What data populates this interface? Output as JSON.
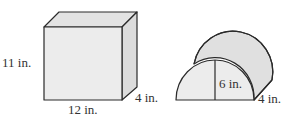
{
  "colors": {
    "face_front": "#ececec",
    "face_top": "#e3e3e3",
    "face_side": "#dcdcdc",
    "stroke": "#2a2a2a"
  },
  "prism": {
    "height_label": "11 in.",
    "width_label": "12 in.",
    "depth_label": "4 in."
  },
  "half_cylinder": {
    "radius_label": "6 in.",
    "depth_label": "4 in."
  }
}
